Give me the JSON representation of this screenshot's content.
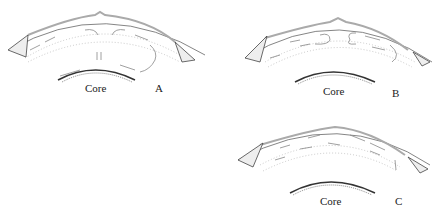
{
  "diagram": {
    "type": "mantle-convection-cross-sections",
    "colors": {
      "line": "#555555",
      "lithosphere": "#999999",
      "stipple": "#444444",
      "background": "#ffffff"
    },
    "panels": [
      {
        "id": "A",
        "letter": "A",
        "core_label": "Core",
        "pattern": "two-layer convection with central upwelling from core"
      },
      {
        "id": "B",
        "letter": "B",
        "core_label": "Core",
        "pattern": "upper-mantle cells with central divergence"
      },
      {
        "id": "C",
        "letter": "C",
        "core_label": "Core",
        "pattern": "single flow toward trench, descending slab"
      }
    ]
  }
}
